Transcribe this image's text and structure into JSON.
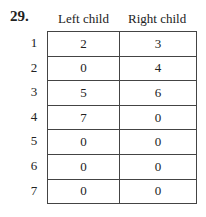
{
  "problem_number": "29.",
  "table": {
    "headers": [
      "Left child",
      "Right child"
    ],
    "rows": [
      {
        "node": "1",
        "left": "2",
        "right": "3"
      },
      {
        "node": "2",
        "left": "0",
        "right": "4"
      },
      {
        "node": "3",
        "left": "5",
        "right": "6"
      },
      {
        "node": "4",
        "left": "7",
        "right": "0"
      },
      {
        "node": "5",
        "left": "0",
        "right": "0"
      },
      {
        "node": "6",
        "left": "0",
        "right": "0"
      },
      {
        "node": "7",
        "left": "0",
        "right": "0"
      }
    ]
  }
}
